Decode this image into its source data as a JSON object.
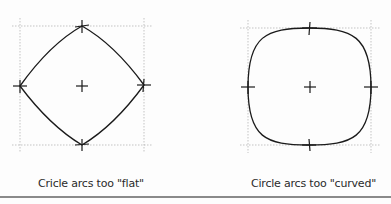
{
  "figures": [
    {
      "id": "flat",
      "caption": "Cricle arcs too \"flat\"",
      "box": {
        "x1": 20,
        "y1": 26,
        "x2": 144,
        "y2": 145
      },
      "center": {
        "x": 82,
        "y": 86
      },
      "shape": "arcs bulging toward center (diamond-like)"
    },
    {
      "id": "curved",
      "caption": "Circle arcs too \"curved\"",
      "box": {
        "x1": 248,
        "y1": 28,
        "x2": 371,
        "y2": 145
      },
      "center": {
        "x": 310,
        "y": 87
      },
      "shape": "arcs bulging outward (squircle-like)"
    }
  ],
  "colors": {
    "stroke": "#1a1a1a",
    "grid": "#9a9a9a",
    "rule": "#8a8a8a"
  }
}
